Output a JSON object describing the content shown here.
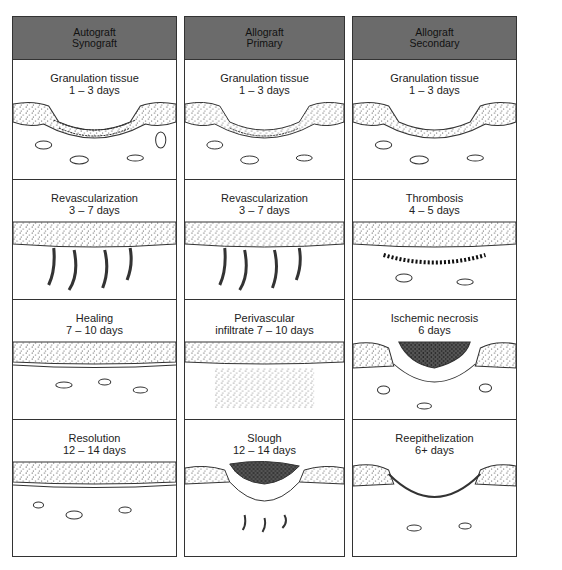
{
  "columns": [
    {
      "header": [
        "Autograft",
        "Synograft"
      ],
      "stages": [
        {
          "title": "Granulation tissue",
          "duration": "1 – 3 days",
          "illustration": "granulation"
        },
        {
          "title": "Revascularization",
          "duration": "3 – 7 days",
          "illustration": "revascular"
        },
        {
          "title": "Healing",
          "duration": "7 – 10 days",
          "illustration": "healing"
        },
        {
          "title": "Resolution",
          "duration": "12 – 14 days",
          "illustration": "resolution"
        }
      ]
    },
    {
      "header": [
        "Allograft",
        "Primary"
      ],
      "stages": [
        {
          "title": "Granulation tissue",
          "duration": "1 – 3 days",
          "illustration": "granulation"
        },
        {
          "title": "Revascularization",
          "duration": "3 – 7 days",
          "illustration": "revascular"
        },
        {
          "title": "Perivascular",
          "duration": "infiltrate 7 – 10 days",
          "illustration": "infiltrate"
        },
        {
          "title": "Slough",
          "duration": "12 – 14 days",
          "illustration": "slough"
        }
      ]
    },
    {
      "header": [
        "Allograft",
        "Secondary"
      ],
      "stages": [
        {
          "title": "Granulation tissue",
          "duration": "1 – 3 days",
          "illustration": "granulation"
        },
        {
          "title": "Thrombosis",
          "duration": "4 – 5 days",
          "illustration": "thrombosis"
        },
        {
          "title": "Ischemic necrosis",
          "duration": "6 days",
          "illustration": "necrosis"
        },
        {
          "title": "Reepithelization",
          "duration": "6+ days",
          "illustration": "reepithelization"
        }
      ]
    }
  ],
  "colors": {
    "header_bg": "#6b6b6b",
    "border": "#333333",
    "ink": "#222222"
  }
}
